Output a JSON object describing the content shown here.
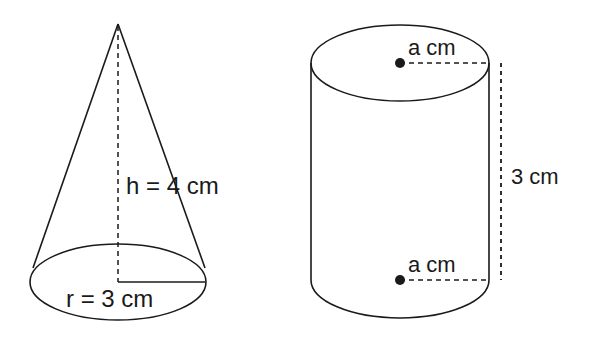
{
  "figures": {
    "cone": {
      "height_label": "h = 4 cm",
      "radius_label": "r = 3 cm"
    },
    "cylinder": {
      "top_radius_label": "a cm",
      "bottom_radius_label": "a cm",
      "height_label": "3 cm"
    }
  },
  "colors": {
    "stroke": "#1a1a1a",
    "background": "#ffffff"
  }
}
